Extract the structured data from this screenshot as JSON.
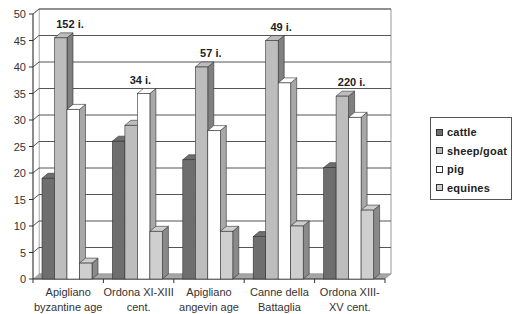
{
  "chart_data": {
    "type": "bar",
    "title": "",
    "xlabel": "",
    "ylabel": "",
    "ylim": [
      0,
      50
    ],
    "yticks": [
      0,
      5,
      10,
      15,
      20,
      25,
      30,
      35,
      40,
      45,
      50
    ],
    "grid": true,
    "legend_position": "right",
    "style": "3d-clustered-column",
    "categories": [
      [
        "Apigliano",
        "byzantine age"
      ],
      [
        "Ordona XI-XIII",
        "cent."
      ],
      [
        "Apigliano",
        "angevin age"
      ],
      [
        "Canne della",
        "Battaglia"
      ],
      [
        "Ordona XIII-",
        "XV cent."
      ]
    ],
    "annotations": [
      "152 i.",
      "34 i.",
      "57 i.",
      "49 i.",
      "220 i."
    ],
    "series": [
      {
        "name": "cattle",
        "color": "#6e6e6e",
        "side": "#4a4a4a",
        "values": [
          19,
          26,
          22.5,
          8,
          21
        ]
      },
      {
        "name": "sheep/goat",
        "color": "#bdbdbd",
        "side": "#808080",
        "values": [
          45.5,
          29,
          40,
          45,
          34.5
        ]
      },
      {
        "name": "pig",
        "color": "#ffffff",
        "side": "#a8a8a8",
        "values": [
          32,
          35,
          28,
          37,
          30.5
        ]
      },
      {
        "name": "equines",
        "color": "#cfcfcf",
        "side": "#8a8a8a",
        "values": [
          3,
          9,
          9,
          10,
          13
        ]
      }
    ]
  }
}
